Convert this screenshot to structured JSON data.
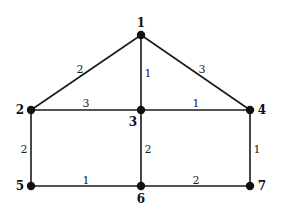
{
  "diagram": {
    "type": "weighted-undirected-graph",
    "colors": {
      "edge": "#1a1a1a",
      "node": "#111111",
      "background": "#ffffff"
    },
    "nodes": [
      {
        "id": "1",
        "label": "1",
        "x": 141,
        "y": 35,
        "label_x": 141,
        "label_y": 23
      },
      {
        "id": "2",
        "label": "2",
        "x": 31,
        "y": 110,
        "label_x": 20,
        "label_y": 110
      },
      {
        "id": "3",
        "label": "3",
        "x": 141,
        "y": 110,
        "label_x": 133,
        "label_y": 122
      },
      {
        "id": "4",
        "label": "4",
        "x": 250,
        "y": 110,
        "label_x": 262,
        "label_y": 110
      },
      {
        "id": "5",
        "label": "5",
        "x": 31,
        "y": 186,
        "label_x": 20,
        "label_y": 186
      },
      {
        "id": "6",
        "label": "6",
        "x": 141,
        "y": 186,
        "label_x": 141,
        "label_y": 199
      },
      {
        "id": "7",
        "label": "7",
        "x": 250,
        "y": 186,
        "label_x": 262,
        "label_y": 186
      }
    ],
    "edges": [
      {
        "from": "1",
        "to": "2",
        "weight": "2",
        "label_x": 80,
        "label_y": 69
      },
      {
        "from": "1",
        "to": "3",
        "weight": "1",
        "label_x": 148,
        "label_y": 73
      },
      {
        "from": "1",
        "to": "4",
        "weight": "3",
        "label_x": 202,
        "label_y": 69
      },
      {
        "from": "2",
        "to": "3",
        "weight": "3",
        "label_x": 86,
        "label_y": 103
      },
      {
        "from": "3",
        "to": "4",
        "weight": "1",
        "label_x": 196,
        "label_y": 103
      },
      {
        "from": "2",
        "to": "5",
        "weight": "2",
        "label_x": 24,
        "label_y": 149
      },
      {
        "from": "3",
        "to": "6",
        "weight": "2",
        "label_x": 148,
        "label_y": 149
      },
      {
        "from": "4",
        "to": "7",
        "weight": "1",
        "label_x": 257,
        "label_y": 149
      },
      {
        "from": "5",
        "to": "6",
        "weight": "1",
        "label_x": 86,
        "label_y": 180
      },
      {
        "from": "6",
        "to": "7",
        "weight": "2",
        "label_x": 196,
        "label_y": 180
      }
    ]
  }
}
